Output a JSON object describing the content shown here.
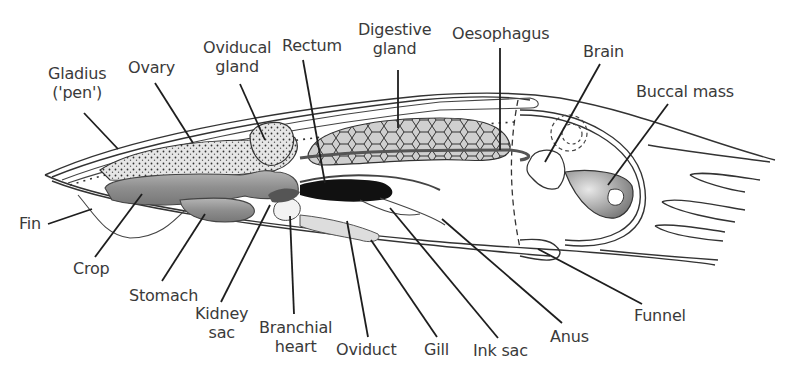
{
  "diagram": {
    "colors": {
      "line": "#1e1e1e",
      "text": "#3a3a3a",
      "organ_grey": "#9a9a9a",
      "organ_light": "#c8c8c8",
      "ink_black": "#111111",
      "background": "#ffffff"
    },
    "labels": {
      "gladius": [
        "Gladius",
        "('pen')"
      ],
      "ovary": [
        "Ovary"
      ],
      "oviducal_gland": [
        "Oviducal",
        "gland"
      ],
      "rectum": [
        "Rectum"
      ],
      "digestive_gland": [
        "Digestive",
        "gland"
      ],
      "oesophagus": [
        "Oesophagus"
      ],
      "brain": [
        "Brain"
      ],
      "buccal_mass": [
        "Buccal mass"
      ],
      "fin": [
        "Fin"
      ],
      "crop": [
        "Crop"
      ],
      "stomach": [
        "Stomach"
      ],
      "kidney_sac": [
        "Kidney",
        "sac"
      ],
      "branchial_heart": [
        "Branchial",
        "heart"
      ],
      "oviduct": [
        "Oviduct"
      ],
      "gill": [
        "Gill"
      ],
      "ink_sac": [
        "Ink sac"
      ],
      "anus": [
        "Anus"
      ],
      "funnel": [
        "Funnel"
      ]
    }
  }
}
